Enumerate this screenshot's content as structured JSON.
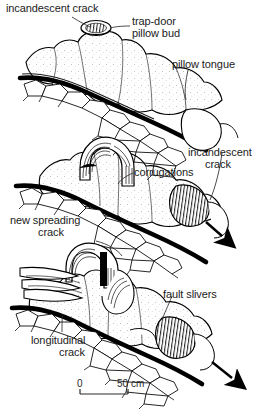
{
  "figure": {
    "type": "geological-line-drawing",
    "background_color": "#ffffff",
    "ink_color": "#000000",
    "stages": 3,
    "arrow_count": 2,
    "arrow_direction": "down-right"
  },
  "labels": {
    "incandescent_crack_top": "incandescent crack",
    "trap_door_line1": "trap-door",
    "trap_door_line2": "pillow bud",
    "pillow_tongue": "pillow tongue",
    "corrugations": "corrugations",
    "incandescent_crack_mid_line1": "incandescent",
    "incandescent_crack_mid_line2": "crack",
    "new_spreading_line1": "new spreading",
    "new_spreading_line2": "crack",
    "fault_slivers": "fault slivers",
    "longitudinal_line1": "longitudinal",
    "longitudinal_line2": "crack"
  },
  "scale_bar": {
    "zero_label": "0",
    "max_label": "50 cm",
    "length_px": 48,
    "units": "cm",
    "value": 50
  }
}
